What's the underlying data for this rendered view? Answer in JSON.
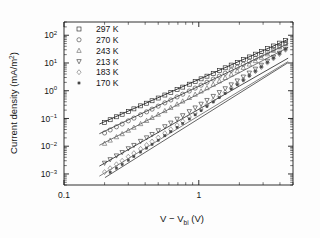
{
  "chart_data": {
    "type": "line",
    "title": "",
    "xlabel": "V − V_bi (V)",
    "xlabel_parts": {
      "pre": "V − V",
      "sub": "bi",
      "post": " (V)"
    },
    "ylabel": "Current density (mA/m²)",
    "ylabel_parts": {
      "pre": "Current density (mA/m",
      "sup": "2",
      "post": ")"
    },
    "xscale": "log",
    "yscale": "log",
    "xlim": [
      0.1,
      5.0
    ],
    "ylim": [
      0.0004,
      300
    ],
    "grid": false,
    "legend_position": "upper-left",
    "x_tick_labels": [
      "0.1",
      "1"
    ],
    "x_tick_values": [
      0.1,
      1
    ],
    "y_tick_labels": [
      "10²",
      "10¹",
      "10⁰",
      "10⁻¹",
      "10⁻²",
      "10⁻³"
    ],
    "y_tick_exponents": [
      "2",
      "1",
      "0",
      "-1",
      "-2",
      "-3"
    ],
    "y_tick_values": [
      100,
      10,
      1,
      0.1,
      0.01,
      0.001
    ],
    "series": [
      {
        "name": "297 K",
        "label": "297 K",
        "marker": "square-open",
        "color": "#1b1b1b",
        "fit_slope": 2.18,
        "fit_intercept_at_1V": 2.55,
        "x": [
          0.2,
          0.22,
          0.245,
          0.27,
          0.3,
          0.33,
          0.37,
          0.41,
          0.45,
          0.5,
          0.56,
          0.62,
          0.69,
          0.76,
          0.85,
          0.94,
          1.04,
          1.15,
          1.28,
          1.42,
          1.57,
          1.74,
          1.93,
          2.14,
          2.37,
          2.63,
          2.91,
          3.23,
          3.58,
          3.97,
          4.4
        ],
        "y": [
          0.072,
          0.09,
          0.115,
          0.142,
          0.18,
          0.222,
          0.285,
          0.355,
          0.435,
          0.545,
          0.7,
          0.875,
          1.1,
          1.35,
          1.72,
          2.15,
          2.68,
          3.35,
          4.25,
          5.35,
          6.7,
          8.4,
          10.5,
          13.2,
          16.5,
          20.8,
          26.0,
          32.8,
          41.0,
          52.0,
          65.0
        ]
      },
      {
        "name": "270 K",
        "label": "270 K",
        "marker": "circle-open",
        "color": "#3a3a3a",
        "fit_slope": 2.32,
        "fit_intercept_at_1V": 1.45,
        "x": [
          0.2,
          0.22,
          0.245,
          0.27,
          0.3,
          0.33,
          0.37,
          0.41,
          0.45,
          0.5,
          0.56,
          0.62,
          0.69,
          0.76,
          0.85,
          0.94,
          1.04,
          1.15,
          1.28,
          1.42,
          1.57,
          1.74,
          1.93,
          2.14,
          2.37,
          2.63,
          2.91,
          3.23,
          3.58,
          3.97,
          4.4
        ],
        "y": [
          0.03,
          0.0385,
          0.05,
          0.063,
          0.082,
          0.103,
          0.136,
          0.173,
          0.217,
          0.278,
          0.365,
          0.465,
          0.598,
          0.75,
          0.975,
          1.245,
          1.585,
          2.02,
          2.62,
          3.36,
          4.29,
          5.49,
          7.01,
          8.98,
          11.45,
          14.7,
          18.8,
          24.2,
          31.0,
          40.1,
          51.2
        ]
      },
      {
        "name": "243 K",
        "label": "243 K",
        "marker": "triangle-up-open",
        "color": "#5c5c5c",
        "fit_slope": 2.52,
        "fit_intercept_at_1V": 0.78,
        "x": [
          0.2,
          0.22,
          0.245,
          0.27,
          0.3,
          0.33,
          0.37,
          0.41,
          0.45,
          0.5,
          0.56,
          0.62,
          0.69,
          0.76,
          0.85,
          0.94,
          1.04,
          1.15,
          1.28,
          1.42,
          1.57,
          1.74,
          1.93,
          2.14,
          2.37,
          2.63,
          2.91,
          3.23,
          3.58,
          3.97,
          4.4
        ],
        "y": [
          0.0125,
          0.0163,
          0.0216,
          0.0278,
          0.037,
          0.0474,
          0.064,
          0.0833,
          0.1065,
          0.14,
          0.1885,
          0.246,
          0.325,
          0.418,
          0.56,
          0.735,
          0.96,
          1.26,
          1.69,
          2.23,
          2.94,
          3.89,
          5.14,
          6.81,
          8.99,
          11.95,
          15.8,
          21.0,
          27.9,
          37.2,
          49.3
        ]
      },
      {
        "name": "213 K",
        "label": "213 K",
        "marker": "triangle-down-open",
        "color": "#2e2e2e",
        "fit_slope": 2.78,
        "fit_intercept_at_1V": 0.215,
        "x": [
          0.2,
          0.22,
          0.245,
          0.27,
          0.3,
          0.33,
          0.37,
          0.41,
          0.45,
          0.5,
          0.56,
          0.62,
          0.69,
          0.76,
          0.85,
          0.94,
          1.04,
          1.15,
          1.28,
          1.42,
          1.57,
          1.74,
          1.93,
          2.14,
          2.37,
          2.63,
          2.91,
          3.23,
          3.58,
          3.97,
          4.4
        ],
        "y": [
          0.00248,
          0.00333,
          0.00455,
          0.00601,
          0.00825,
          0.01085,
          0.0152,
          0.0204,
          0.0269,
          0.0367,
          0.0514,
          0.0695,
          0.0956,
          0.128,
          0.179,
          0.244,
          0.332,
          0.453,
          0.634,
          0.874,
          1.2,
          1.66,
          2.29,
          3.17,
          4.39,
          6.09,
          8.43,
          11.75,
          16.3,
          22.8,
          31.8
        ]
      },
      {
        "name": "183 K",
        "label": "183 K",
        "marker": "diamond-open",
        "color": "#6b6b6b",
        "fit_slope": 2.95,
        "fit_intercept_at_1V": 0.125,
        "x": [
          0.2,
          0.22,
          0.245,
          0.27,
          0.3,
          0.33,
          0.37,
          0.41,
          0.45,
          0.5,
          0.56,
          0.62,
          0.69,
          0.76,
          0.85,
          0.94,
          1.04,
          1.15,
          1.28,
          1.42,
          1.57,
          1.74,
          1.93,
          2.14,
          2.37,
          2.63,
          2.91,
          3.23,
          3.58,
          3.97,
          4.4
        ],
        "y": [
          0.00117,
          0.0016,
          0.00223,
          0.00299,
          0.00419,
          0.00562,
          0.00805,
          0.01105,
          0.0148,
          0.0206,
          0.0295,
          0.0408,
          0.0575,
          0.0785,
          0.113,
          0.157,
          0.219,
          0.306,
          0.439,
          0.621,
          0.873,
          1.24,
          1.75,
          2.48,
          3.53,
          5.03,
          7.15,
          10.25,
          14.6,
          20.9,
          29.9
        ]
      },
      {
        "name": "170 K",
        "label": "170 K",
        "marker": "square-filled-small",
        "color": "#474747",
        "fit_slope": 3.05,
        "fit_intercept_at_1V": 0.098,
        "x": [
          0.22,
          0.245,
          0.27,
          0.3,
          0.33,
          0.37,
          0.41,
          0.45,
          0.5,
          0.56,
          0.62,
          0.69,
          0.76,
          0.85,
          0.94,
          1.04,
          1.15,
          1.28,
          1.42,
          1.57,
          1.74,
          1.93,
          2.14,
          2.37,
          2.63,
          2.91,
          3.23,
          3.58,
          3.97,
          4.4
        ],
        "y": [
          0.00115,
          0.00162,
          0.0022,
          0.00313,
          0.00424,
          0.00617,
          0.00856,
          0.0116,
          0.0164,
          0.0238,
          0.0333,
          0.0477,
          0.0659,
          0.0962,
          0.135,
          0.191,
          0.271,
          0.394,
          0.566,
          0.806,
          1.16,
          1.66,
          2.39,
          3.45,
          4.99,
          7.18,
          10.5,
          15.1,
          21.9,
          31.8
        ]
      }
    ]
  },
  "legend": {
    "entries": [
      {
        "label": "297 K",
        "marker": "square-open"
      },
      {
        "label": "270 K",
        "marker": "circle-open"
      },
      {
        "label": "243 K",
        "marker": "triangle-up-open"
      },
      {
        "label": "213 K",
        "marker": "triangle-down-open"
      },
      {
        "label": "183 K",
        "marker": "diamond-open"
      },
      {
        "label": "170 K",
        "marker": "square-filled-small"
      }
    ]
  },
  "colors": {
    "axis": "#1a1a1a",
    "background": "#fdfdfd",
    "text": "#151515"
  }
}
